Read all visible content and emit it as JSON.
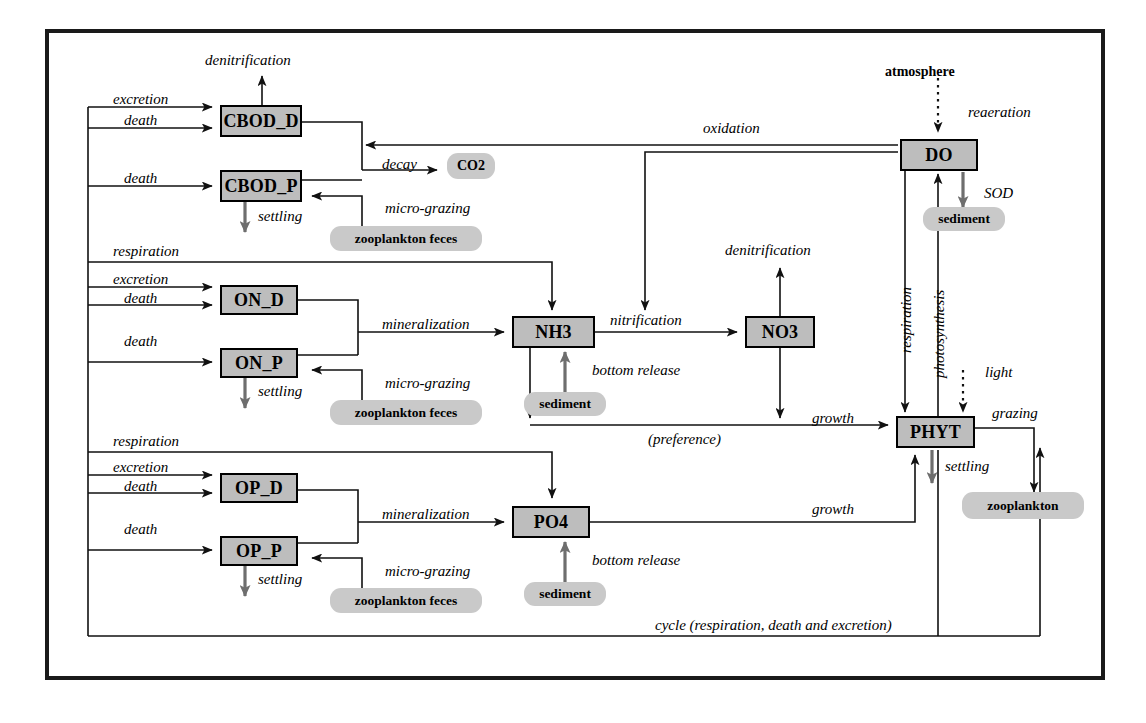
{
  "diagram": {
    "type": "water-quality-model-flow-diagram",
    "frame": {
      "stroke": "#111111"
    },
    "colors": {
      "box_fill": "#bdbdbd",
      "pill_fill": "#c9c9c9",
      "line": "#111111",
      "background": "#ffffff"
    },
    "state_variables": [
      {
        "id": "cbod_d",
        "label": "CBOD_D"
      },
      {
        "id": "cbod_p",
        "label": "CBOD_P"
      },
      {
        "id": "on_d",
        "label": "ON_D"
      },
      {
        "id": "on_p",
        "label": "ON_P"
      },
      {
        "id": "op_d",
        "label": "OP_D"
      },
      {
        "id": "op_p",
        "label": "OP_P"
      },
      {
        "id": "nh3",
        "label": "NH3"
      },
      {
        "id": "no3",
        "label": "NO3"
      },
      {
        "id": "po4",
        "label": "PO4"
      },
      {
        "id": "do",
        "label": "DO"
      },
      {
        "id": "phyt",
        "label": "PHYT"
      }
    ],
    "external_nodes": [
      {
        "id": "co2",
        "label": "CO2"
      },
      {
        "id": "zoo_feces_cbod",
        "label": "zooplankton feces"
      },
      {
        "id": "zoo_feces_on",
        "label": "zooplankton feces"
      },
      {
        "id": "zoo_feces_op",
        "label": "zooplankton feces"
      },
      {
        "id": "sediment_do",
        "label": "sediment"
      },
      {
        "id": "sediment_nh3",
        "label": "sediment"
      },
      {
        "id": "sediment_po4",
        "label": "sediment"
      },
      {
        "id": "zooplankton",
        "label": "zooplankton"
      },
      {
        "id": "atmosphere",
        "label": "atmosphere"
      }
    ],
    "flow_labels": {
      "denitrification_cbod": "denitrification",
      "excretion_cbod": "excretion",
      "death_cbod_d": "death",
      "death_cbod_p": "death",
      "decay": "decay",
      "settling_cbod_p": "settling",
      "micro_grazing_cbod": "micro-grazing",
      "respiration_on": "respiration",
      "excretion_on": "excretion",
      "death_on_d": "death",
      "death_on_p": "death",
      "mineralization_on": "mineralization",
      "settling_on_p": "settling",
      "micro_grazing_on": "micro-grazing",
      "respiration_op": "respiration",
      "excretion_op": "excretion",
      "death_op_d": "death",
      "death_op_p": "death",
      "mineralization_op": "mineralization",
      "settling_op_p": "settling",
      "micro_grazing_op": "micro-grazing",
      "oxidation": "oxidation",
      "reaeration": "reaeration",
      "sod": "SOD",
      "nitrification": "nitrification",
      "denitrification_no3": "denitrification",
      "bottom_release_nh3": "bottom release",
      "bottom_release_po4": "bottom release",
      "preference": "(preference)",
      "growth_n": "growth",
      "growth_p": "growth",
      "respiration_phyt": "respiration",
      "photosynthesis": "photosynthesis",
      "light": "light",
      "grazing": "grazing",
      "settling_phyt": "settling",
      "cycle": "cycle (respiration, death and excretion)"
    }
  }
}
